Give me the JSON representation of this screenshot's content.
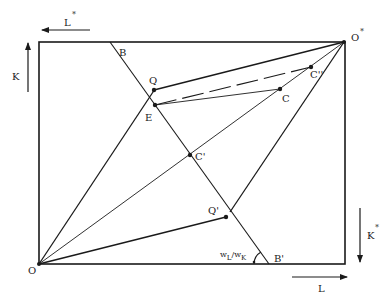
{
  "diagram": {
    "type": "edgeworth-box",
    "colors": {
      "ink": "#1a1a1a",
      "background": "#ffffff"
    },
    "origins": {
      "home": {
        "label": "O"
      },
      "foreign": {
        "label": "O",
        "superscript": "*"
      }
    },
    "axes": {
      "top_arrow": {
        "label": "L",
        "superscript": "*",
        "direction": "left"
      },
      "left_arrow": {
        "label": "K",
        "direction": "up"
      },
      "right_arrow": {
        "label": "K",
        "superscript": "*",
        "direction": "down"
      },
      "bottom_arrow": {
        "label": "L",
        "direction": "right"
      }
    },
    "points": {
      "B": "B",
      "B_prime": "B'",
      "Q": "Q",
      "E": "E",
      "C": "C",
      "C_double_prime": "C''",
      "C_prime": "C'",
      "Q_prime": "Q'"
    },
    "angle_label": {
      "w_L": "w",
      "sub_L": "L",
      "slash": "/",
      "w_K": "w",
      "sub_K": "K"
    }
  }
}
